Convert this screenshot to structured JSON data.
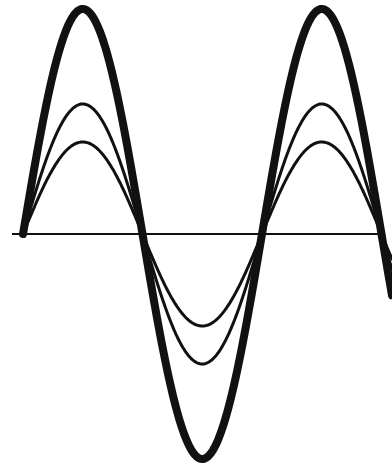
{
  "diagram": {
    "description": "Three in-phase sine waves of differing amplitude sharing a horizontal axis",
    "colors": {
      "stroke": "#111111",
      "background": "#ffffff"
    },
    "axis": {
      "y": 234,
      "x_start": 12,
      "x_end": 385
    },
    "period_px": 239,
    "phase_start_x": 23,
    "waves": [
      {
        "name": "large",
        "amplitude": 225,
        "stroke_width": 8
      },
      {
        "name": "medium",
        "amplitude": 130,
        "stroke_width": 3
      },
      {
        "name": "small",
        "amplitude": 92,
        "stroke_width": 3
      }
    ]
  }
}
